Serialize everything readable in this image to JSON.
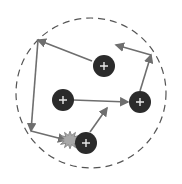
{
  "diagram": {
    "boundary": {
      "cx": 91,
      "cy": 93,
      "r": 75,
      "stroke": "#555555",
      "dash": "7 5"
    },
    "particle_style": {
      "r": 11,
      "fill": "#2b2b2b",
      "symbol": "+",
      "symbol_color": "#e8e8e8"
    },
    "particles": [
      {
        "id": "p1",
        "cx": 104,
        "cy": 66
      },
      {
        "id": "p2",
        "cx": 63,
        "cy": 100
      },
      {
        "id": "p3",
        "cx": 140,
        "cy": 102
      },
      {
        "id": "p4",
        "cx": 86,
        "cy": 143
      }
    ],
    "arrow_color": "#6e6e6e",
    "paths": [
      {
        "x1": 92,
        "y1": 61,
        "x2": 38,
        "y2": 40
      },
      {
        "x1": 38,
        "y1": 40,
        "x2": 31,
        "y2": 131
      },
      {
        "x1": 31,
        "y1": 131,
        "x2": 66,
        "y2": 140
      },
      {
        "x1": 73,
        "y1": 100,
        "x2": 128,
        "y2": 102
      },
      {
        "x1": 140,
        "y1": 91,
        "x2": 151,
        "y2": 55
      },
      {
        "x1": 151,
        "y1": 55,
        "x2": 116,
        "y2": 45
      },
      {
        "x1": 90,
        "y1": 132,
        "x2": 107,
        "y2": 108
      }
    ],
    "collision": {
      "cx": 70,
      "cy": 140,
      "fill": "#a8a8a8",
      "stroke": "#777777"
    }
  }
}
